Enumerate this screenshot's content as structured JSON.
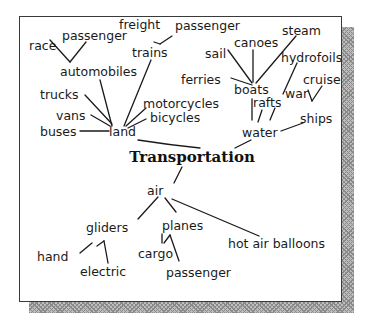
{
  "diagram": {
    "title": "Transportation",
    "branches": {
      "land": {
        "label": "land",
        "children": [
          "buses",
          "vans",
          "trucks",
          "automobiles",
          "trains",
          "motorcycles",
          "bicycles"
        ],
        "automobiles": [
          "race",
          "passenger"
        ],
        "trains": [
          "freight",
          "passenger"
        ]
      },
      "water": {
        "label": "water",
        "children": [
          "boats",
          "rafts",
          "ships"
        ],
        "boats": [
          "ferries",
          "sail",
          "canoes",
          "steam"
        ],
        "rafts_related": [
          "hydrofoils"
        ],
        "ships": [
          "war",
          "cruise"
        ]
      },
      "air": {
        "label": "air",
        "children": [
          "gliders",
          "planes",
          "hot air balloons"
        ],
        "gliders": [
          "hand",
          "electric"
        ],
        "planes": [
          "cargo",
          "passenger"
        ]
      }
    },
    "nodes": {
      "transportation": "Transportation",
      "land": "land",
      "buses": "buses",
      "vans": "vans",
      "trucks": "trucks",
      "automobiles": "automobiles",
      "race": "race",
      "passenger_auto": "passenger",
      "trains": "trains",
      "freight": "freight",
      "passenger_train": "passenger",
      "motorcycles": "motorcycles",
      "bicycles": "bicycles",
      "water": "water",
      "boats": "boats",
      "ferries": "ferries",
      "sail": "sail",
      "canoes": "canoes",
      "steam": "steam",
      "hydrofoils": "hydrofoils",
      "rafts": "rafts",
      "ships": "ships",
      "war": "war",
      "cruise": "cruise",
      "air": "air",
      "gliders": "gliders",
      "hand": "hand",
      "electric": "electric",
      "planes": "planes",
      "cargo": "cargo",
      "passenger_plane": "passenger",
      "hot_air_balloons": "hot air balloons"
    }
  }
}
